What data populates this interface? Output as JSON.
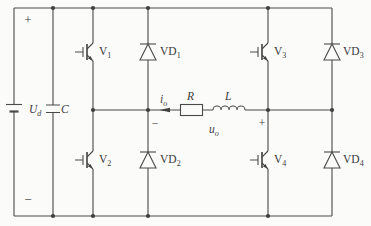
{
  "colors": {
    "line": "#4a4a4a",
    "label": "#3a3a3a",
    "background": "#fbfbfa"
  },
  "labels": {
    "dc_plus": "+",
    "dc_minus": "−",
    "source": {
      "main": "U",
      "sub": "d"
    },
    "capacitor": {
      "main": "C",
      "sub": ""
    },
    "v1": {
      "main": "V",
      "sub": "1"
    },
    "v2": {
      "main": "V",
      "sub": "2"
    },
    "v3": {
      "main": "V",
      "sub": "3"
    },
    "v4": {
      "main": "V",
      "sub": "4"
    },
    "vd1": {
      "main": "VD",
      "sub": "1"
    },
    "vd2": {
      "main": "VD",
      "sub": "2"
    },
    "vd3": {
      "main": "VD",
      "sub": "3"
    },
    "vd4": {
      "main": "VD",
      "sub": "4"
    },
    "current": {
      "main": "i",
      "sub": "o"
    },
    "resistor": {
      "main": "R",
      "sub": ""
    },
    "inductor": {
      "main": "L",
      "sub": ""
    },
    "voltage": {
      "main": "u",
      "sub": "o"
    },
    "load_minus": "−",
    "load_plus": "+"
  }
}
